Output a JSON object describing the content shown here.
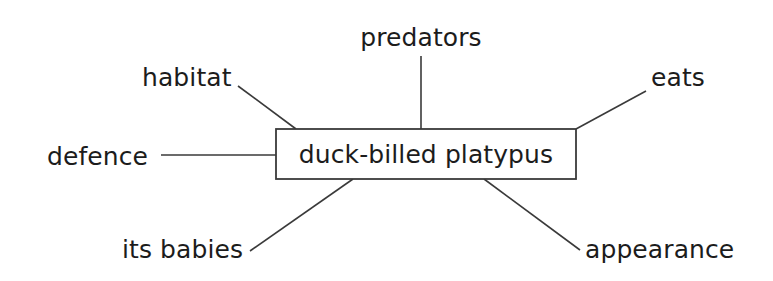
{
  "diagram": {
    "type": "spider-map",
    "center": {
      "label": "duck-billed platypus",
      "box": {
        "x": 276,
        "y": 129,
        "width": 300,
        "height": 50
      }
    },
    "stroke_color": "#3a3a3a",
    "text_color": "#1c1c1c",
    "background_color": "#ffffff",
    "branches": [
      {
        "id": "habitat",
        "label": "habitat",
        "text_x": 142,
        "text_y": 86,
        "anchor": "start",
        "line": {
          "x1": 238,
          "y1": 86,
          "x2": 296,
          "y2": 129
        }
      },
      {
        "id": "predators",
        "label": "predators",
        "text_x": 421,
        "text_y": 46,
        "anchor": "middle",
        "line": {
          "x1": 421,
          "y1": 56,
          "x2": 421,
          "y2": 129
        }
      },
      {
        "id": "eats",
        "label": "eats",
        "text_x": 651,
        "text_y": 86,
        "anchor": "start",
        "line": {
          "x1": 576,
          "y1": 129,
          "x2": 646,
          "y2": 91
        }
      },
      {
        "id": "defence",
        "label": "defence",
        "text_x": 47,
        "text_y": 165,
        "anchor": "start",
        "line": {
          "x1": 161,
          "y1": 155,
          "x2": 276,
          "y2": 155
        }
      },
      {
        "id": "its-babies",
        "label": "its babies",
        "text_x": 122,
        "text_y": 258,
        "anchor": "start",
        "line": {
          "x1": 250,
          "y1": 251,
          "x2": 353,
          "y2": 179
        }
      },
      {
        "id": "appearance",
        "label": "appearance",
        "text_x": 585,
        "text_y": 258,
        "anchor": "start",
        "line": {
          "x1": 484,
          "y1": 179,
          "x2": 580,
          "y2": 250
        }
      }
    ]
  }
}
